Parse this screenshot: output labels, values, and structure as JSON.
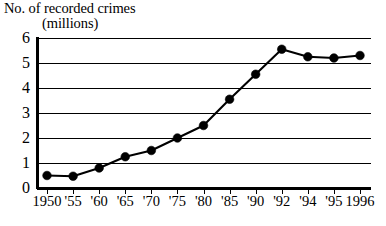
{
  "chart_data": {
    "type": "line",
    "title": "No. of recorded crimes (millions)",
    "title_lines": [
      "No. of recorded crimes",
      "(millions)"
    ],
    "xlabel": "",
    "ylabel": "No. of recorded crimes (millions)",
    "ylim": [
      0,
      6
    ],
    "yticks": [
      0,
      1,
      2,
      3,
      4,
      5,
      6
    ],
    "ytick_labels": [
      "0",
      "1",
      "2",
      "3",
      "4",
      "5",
      "6"
    ],
    "grid": "horizontal",
    "legend": "none",
    "axis_scale": "categorical-even-spacing",
    "categories": [
      "1950",
      "'55",
      "'60",
      "'65",
      "'70",
      "'75",
      "'80",
      "'85",
      "'90",
      "'92",
      "'94",
      "'95",
      "1996"
    ],
    "years": [
      1950,
      1955,
      1960,
      1965,
      1970,
      1975,
      1980,
      1985,
      1990,
      1992,
      1994,
      1995,
      1996
    ],
    "values": [
      0.5,
      0.47,
      0.8,
      1.25,
      1.5,
      2.0,
      2.5,
      3.55,
      4.55,
      5.55,
      5.25,
      5.2,
      5.3
    ],
    "series": [
      {
        "name": "Recorded crimes",
        "values": [
          0.5,
          0.47,
          0.8,
          1.25,
          1.5,
          2.0,
          2.5,
          3.55,
          4.55,
          5.55,
          5.25,
          5.2,
          5.3
        ]
      }
    ],
    "marker": "filled-circle",
    "colors": {
      "line": "#000000",
      "marker": "#000000",
      "grid": "#000000",
      "axis": "#000000",
      "background": "#ffffff"
    }
  }
}
